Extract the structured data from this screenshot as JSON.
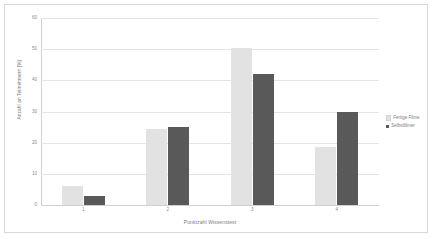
{
  "chart_data": {
    "type": "bar",
    "title": "",
    "xlabel": "Punktzahl Wissenstest",
    "ylabel": "Anzahl an Teilnehmern [%]",
    "categories": [
      "1",
      "2",
      "3",
      "4"
    ],
    "series": [
      {
        "name": "Fertige Filme",
        "color": "#e2e2e2",
        "values": [
          6,
          24.5,
          50.5,
          18.5
        ]
      },
      {
        "name": "Selbstfilmer",
        "color": "#595959",
        "values": [
          3,
          25,
          42,
          30
        ]
      }
    ],
    "ylim": [
      0,
      60
    ],
    "ytick_labels": [
      "0",
      "10",
      "20",
      "30",
      "40",
      "50",
      "60"
    ],
    "ytick_values": [
      0,
      10,
      20,
      30,
      40,
      50,
      60
    ],
    "grid": true,
    "legend_position": "right"
  },
  "legend": {
    "items": [
      {
        "label": "Fertige Filme"
      },
      {
        "label": "Selbstfilmer"
      }
    ]
  },
  "axes": {
    "x_title": "Punktzahl Wissenstest",
    "y_title": "Anzahl an Teilnehmern [%]"
  },
  "colors": {
    "series_light": "#e2e2e2",
    "series_dark": "#595959",
    "gridline": "#e4e4e4",
    "border": "#d9d9d9",
    "text": "#7d7d7d"
  }
}
